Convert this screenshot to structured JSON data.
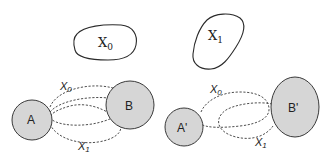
{
  "top_sets": {
    "x0": {
      "label": "X",
      "subscript": "0"
    },
    "x1": {
      "label": "X",
      "subscript": "1"
    }
  },
  "left_panel": {
    "node_a": "A",
    "node_b": "B",
    "path_upper": {
      "label": "X",
      "subscript": "0"
    },
    "path_lower": {
      "label": "X",
      "subscript": "1"
    }
  },
  "right_panel": {
    "node_a": "A'",
    "node_b": "B'",
    "path_upper": {
      "label": "X",
      "subscript": "0"
    },
    "path_lower": {
      "label": "X",
      "subscript": "1"
    }
  },
  "colors": {
    "node_fill": "#d6d6d6",
    "stroke": "#2a2a2a",
    "background": "#ffffff"
  }
}
